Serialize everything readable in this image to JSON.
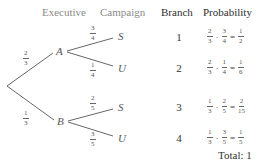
{
  "headers": {
    "executive": "Executive",
    "campaign": "Campaign",
    "branch": "Branch",
    "probability": "Probability"
  },
  "nodes": {
    "A": "A",
    "B": "B",
    "S1": "S",
    "U1": "U",
    "S2": "S",
    "U2": "U"
  },
  "edges": {
    "root_A": {
      "num": "2",
      "den": "3"
    },
    "root_B": {
      "num": "1",
      "den": "3"
    },
    "A_S": {
      "num": "3",
      "den": "4"
    },
    "A_U": {
      "num": "1",
      "den": "4"
    },
    "B_S": {
      "num": "2",
      "den": "5"
    },
    "B_U": {
      "num": "3",
      "den": "5"
    }
  },
  "rows": [
    {
      "branch": "1",
      "f1": {
        "num": "2",
        "den": "3"
      },
      "dot": "·",
      "f2": {
        "num": "3",
        "den": "4"
      },
      "eq": "=",
      "res": {
        "num": "1",
        "den": "2"
      }
    },
    {
      "branch": "2",
      "f1": {
        "num": "2",
        "den": "3"
      },
      "dot": "·",
      "f2": {
        "num": "1",
        "den": "4"
      },
      "eq": "=",
      "res": {
        "num": "1",
        "den": "6"
      }
    },
    {
      "branch": "3",
      "f1": {
        "num": "1",
        "den": "3"
      },
      "dot": "·",
      "f2": {
        "num": "2",
        "den": "5"
      },
      "eq": "=",
      "res": {
        "num": "2",
        "den": "15"
      }
    },
    {
      "branch": "4",
      "f1": {
        "num": "1",
        "den": "3"
      },
      "dot": "·",
      "f2": {
        "num": "3",
        "den": "5"
      },
      "eq": "=",
      "res": {
        "num": "1",
        "den": "5"
      }
    }
  ],
  "total": "Total: 1",
  "colors": {
    "line": "#555555",
    "header_gray": "#8a8a8a",
    "header_dark": "#2e2e2e"
  }
}
